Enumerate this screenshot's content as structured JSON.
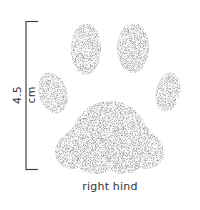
{
  "figure": {
    "caption": "right hind",
    "scale_bar": {
      "label": "4.5 cm",
      "orientation": "vertical"
    },
    "pads": [
      {
        "name": "toe-inner-left",
        "shape": "ellipse"
      },
      {
        "name": "toe-top-left",
        "shape": "ellipse"
      },
      {
        "name": "toe-top-right",
        "shape": "ellipse"
      },
      {
        "name": "toe-outer-right",
        "shape": "ellipse"
      },
      {
        "name": "main-pad",
        "shape": "trilobed"
      }
    ],
    "colors": {
      "ink": "#333333",
      "stipple": "#555555",
      "background": "#ffffff"
    }
  }
}
